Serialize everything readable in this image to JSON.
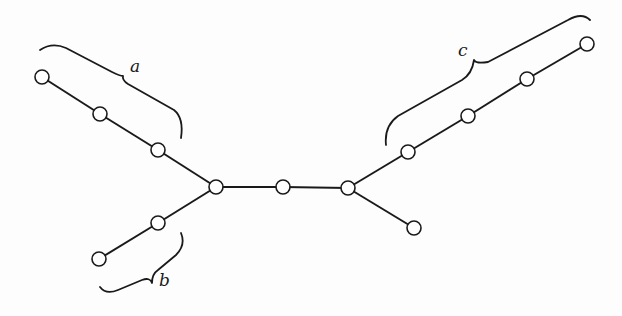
{
  "diagram": {
    "type": "tree",
    "nodes": [
      {
        "id": "n1",
        "x": 42,
        "y": 77
      },
      {
        "id": "n2",
        "x": 100,
        "y": 114
      },
      {
        "id": "n3",
        "x": 158,
        "y": 150
      },
      {
        "id": "n4",
        "x": 216,
        "y": 187
      },
      {
        "id": "n5",
        "x": 283,
        "y": 187
      },
      {
        "id": "n6",
        "x": 348,
        "y": 188
      },
      {
        "id": "n7",
        "x": 158,
        "y": 223
      },
      {
        "id": "n8",
        "x": 99,
        "y": 259
      },
      {
        "id": "n9",
        "x": 408,
        "y": 152
      },
      {
        "id": "n10",
        "x": 468,
        "y": 116
      },
      {
        "id": "n11",
        "x": 527,
        "y": 79
      },
      {
        "id": "n12",
        "x": 587,
        "y": 44
      },
      {
        "id": "n13",
        "x": 414,
        "y": 228
      }
    ],
    "edges": [
      [
        "n1",
        "n2"
      ],
      [
        "n2",
        "n3"
      ],
      [
        "n3",
        "n4"
      ],
      [
        "n4",
        "n5"
      ],
      [
        "n5",
        "n6"
      ],
      [
        "n4",
        "n7"
      ],
      [
        "n7",
        "n8"
      ],
      [
        "n6",
        "n9"
      ],
      [
        "n9",
        "n10"
      ],
      [
        "n10",
        "n11"
      ],
      [
        "n11",
        "n12"
      ],
      [
        "n6",
        "n13"
      ]
    ],
    "braces": [
      {
        "label": "a",
        "covers": [
          "n1",
          "n2",
          "n3"
        ]
      },
      {
        "label": "b",
        "covers": [
          "n7",
          "n8"
        ]
      },
      {
        "label": "c",
        "covers": [
          "n9",
          "n10",
          "n11",
          "n12"
        ]
      }
    ]
  },
  "labels": {
    "a": "a",
    "b": "b",
    "c": "c"
  }
}
